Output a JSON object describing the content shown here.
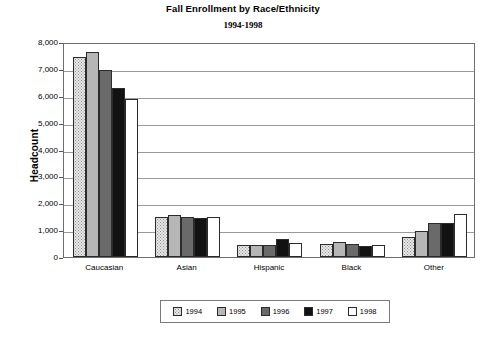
{
  "chart_data": {
    "type": "bar",
    "title": "Fall Enrollment by Race/Ethnicity",
    "subtitle": "1994-1998",
    "xlabel": "",
    "ylabel": "Headcount",
    "ylim": [
      0,
      8000
    ],
    "ytick_labels": [
      "8,000",
      "7,000",
      "6,000",
      "5,000",
      "4,000",
      "3,000",
      "2,000",
      "1,000",
      "0"
    ],
    "ytick_values": [
      8000,
      7000,
      6000,
      5000,
      4000,
      3000,
      2000,
      1000,
      0
    ],
    "grid": true,
    "legend_position": "bottom",
    "categories": [
      "Caucasian",
      "Asian",
      "Hispanic",
      "Black",
      "Other"
    ],
    "series": [
      {
        "name": "1994",
        "color": "#e8e8e8",
        "values": [
          7460,
          1490,
          440,
          500,
          740
        ]
      },
      {
        "name": "1995",
        "color": "#b6b6b6",
        "values": [
          7620,
          1580,
          440,
          560,
          960
        ]
      },
      {
        "name": "1996",
        "color": "#6a6a6a",
        "values": [
          6950,
          1480,
          450,
          490,
          1250
        ]
      },
      {
        "name": "1997",
        "color": "#121212",
        "values": [
          6300,
          1440,
          660,
          410,
          1250
        ]
      },
      {
        "name": "1998",
        "color": "#ffffff",
        "values": [
          5880,
          1500,
          540,
          440,
          1590
        ]
      }
    ]
  }
}
